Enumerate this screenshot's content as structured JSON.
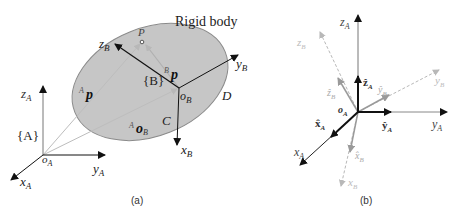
{
  "panel_a": {
    "caption": "(a)",
    "title": "Rigid body",
    "frame_A": {
      "label": "{A}",
      "origin": "o",
      "origin_sub": "A",
      "x": "x",
      "x_sub": "A",
      "y": "y",
      "y_sub": "A",
      "z": "z",
      "z_sub": "A"
    },
    "frame_B": {
      "label": "{B}",
      "origin": "o",
      "origin_sub": "B",
      "x": "x",
      "x_sub": "B",
      "y": "y",
      "y_sub": "B",
      "z": "z",
      "z_sub": "B"
    },
    "point": "P",
    "vectors": {
      "Ap": {
        "sup": "A",
        "body": "p"
      },
      "Bp": {
        "sup": "B",
        "body": "p"
      },
      "AoB": {
        "sup": "A",
        "body": "o",
        "sub": "B"
      }
    },
    "points": {
      "C": "C",
      "D": "D"
    }
  },
  "panel_b": {
    "caption": "(b)",
    "origin": "o",
    "origin_sub": "A",
    "labels": {
      "zA": {
        "t": "z",
        "s": "A"
      },
      "yA": {
        "t": "y",
        "s": "A"
      },
      "xA": {
        "t": "x",
        "s": "A"
      },
      "zhatA": {
        "t": "ẑ",
        "s": "A"
      },
      "yhatA": {
        "t": "ŷ",
        "s": "A"
      },
      "xhatA": {
        "t": "x̂",
        "s": "A"
      },
      "zB": {
        "t": "z",
        "s": "B"
      },
      "yB": {
        "t": "y",
        "s": "B"
      },
      "xB": {
        "t": "x",
        "s": "B"
      },
      "zhatB": {
        "t": "ẑ",
        "s": "B"
      },
      "yhatB": {
        "t": "ŷ",
        "s": "B"
      },
      "xhatB": {
        "t": "x̂",
        "s": "B"
      }
    }
  },
  "colors": {
    "body_fill": "#c8c8c8",
    "body_stroke": "#8a8a8a",
    "dark": "#111111",
    "gray": "#999999",
    "light": "#b5b5b5"
  }
}
